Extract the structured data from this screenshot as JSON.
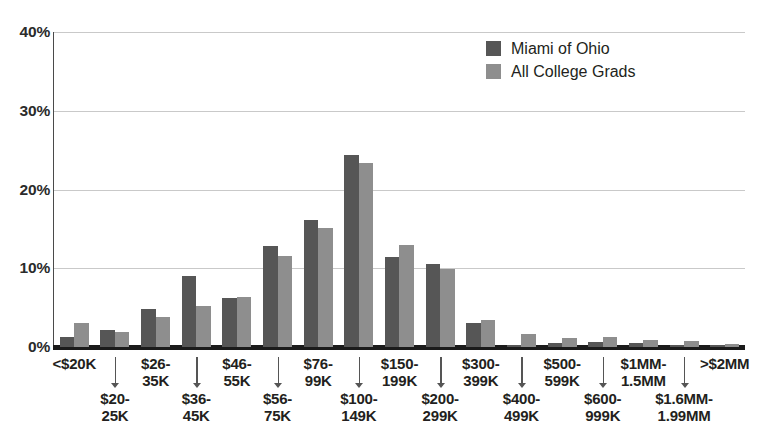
{
  "chart_data": {
    "type": "bar",
    "title": "",
    "subtitle": "",
    "xlabel": "",
    "ylabel": "",
    "ylim": [
      0,
      40
    ],
    "yticks": [
      "0%",
      "10%",
      "20%",
      "30%",
      "40%"
    ],
    "ytick_values": [
      0,
      10,
      20,
      30,
      40
    ],
    "grid": "horizontal",
    "legend_position": "top-right",
    "categories": [
      "<$20K",
      "$20-\n25K",
      "$26-\n35K",
      "$36-\n45K",
      "$46-\n55K",
      "$56-\n75K",
      "$76-\n99K",
      "$100-\n149K",
      "$150-\n199K",
      "$200-\n299K",
      "$300-\n399K",
      "$400-\n499K",
      "$500-\n599K",
      "$600-\n999K",
      "$1MM-\n1.5MM",
      "$1.6MM-\n1.99MM",
      ">$2MM"
    ],
    "category_labels": [
      {
        "line1": "<$20K",
        "line2": "",
        "row": "top"
      },
      {
        "line1": "$20-",
        "line2": "25K",
        "row": "bottom"
      },
      {
        "line1": "$26-",
        "line2": "35K",
        "row": "top"
      },
      {
        "line1": "$36-",
        "line2": "45K",
        "row": "bottom"
      },
      {
        "line1": "$46-",
        "line2": "55K",
        "row": "top"
      },
      {
        "line1": "$56-",
        "line2": "75K",
        "row": "bottom"
      },
      {
        "line1": "$76-",
        "line2": "99K",
        "row": "top"
      },
      {
        "line1": "$100-",
        "line2": "149K",
        "row": "bottom"
      },
      {
        "line1": "$150-",
        "line2": "199K",
        "row": "top"
      },
      {
        "line1": "$200-",
        "line2": "299K",
        "row": "bottom"
      },
      {
        "line1": "$300-",
        "line2": "399K",
        "row": "top"
      },
      {
        "line1": "$400-",
        "line2": "499K",
        "row": "bottom"
      },
      {
        "line1": "$500-",
        "line2": "599K",
        "row": "top"
      },
      {
        "line1": "$600-",
        "line2": "999K",
        "row": "bottom"
      },
      {
        "line1": "$1MM-",
        "line2": "1.5MM",
        "row": "top"
      },
      {
        "line1": "$1.6MM-",
        "line2": "1.99MM",
        "row": "bottom"
      },
      {
        "line1": ">$2MM",
        "line2": "",
        "row": "top"
      }
    ],
    "series": [
      {
        "name": "Miami of Ohio",
        "color": "#565656",
        "values": [
          1.3,
          2.2,
          4.8,
          9.0,
          6.2,
          12.8,
          16.1,
          24.4,
          11.4,
          10.6,
          3.0,
          0.2,
          0.5,
          0.7,
          0.5,
          0.3,
          0.3
        ]
      },
      {
        "name": "All College Grads",
        "color": "#8e8e8e",
        "values": [
          3.0,
          1.9,
          3.8,
          5.2,
          6.3,
          11.5,
          15.1,
          23.4,
          12.9,
          9.9,
          3.4,
          1.7,
          1.1,
          1.3,
          0.9,
          0.8,
          0.4
        ]
      }
    ]
  },
  "legend": {
    "items": [
      {
        "label": "Miami of Ohio",
        "color": "#565656"
      },
      {
        "label": "All College Grads",
        "color": "#8e8e8e"
      }
    ]
  },
  "colors": {
    "series_dark": "#565656",
    "series_light": "#8e8e8e",
    "gridline": "#c9c9c9",
    "axis": "#1b1b1b",
    "text": "#231f20"
  }
}
